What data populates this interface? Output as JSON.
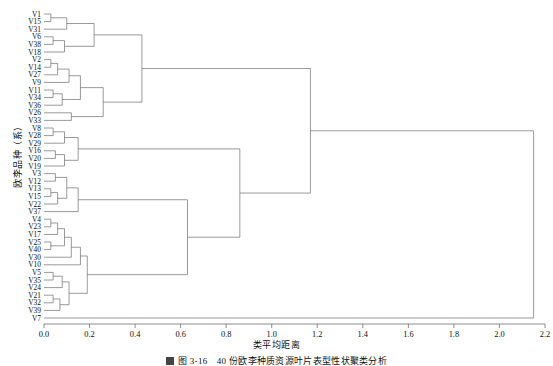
{
  "figure": {
    "y_axis_label": "欧李品种（系）",
    "x_axis_label": "类平均距离",
    "caption": "图 3-16　40 份欧李种质资源叶片表型性状聚类分析"
  },
  "chart_data": {
    "type": "dendrogram",
    "title": "",
    "xlabel": "类平均距离",
    "ylabel": "欧李品种（系）",
    "xlim": [
      0.0,
      2.2
    ],
    "xticks": [
      "0.0",
      "0.2",
      "0.4",
      "0.6",
      "0.8",
      "1.0",
      "1.2",
      "1.4",
      "1.6",
      "1.8",
      "2.0",
      "2.2"
    ],
    "xtick_values": [
      0.0,
      0.2,
      0.4,
      0.6,
      0.8,
      1.0,
      1.2,
      1.4,
      1.6,
      1.8,
      2.0,
      2.2
    ],
    "grid": false,
    "legend": "none",
    "orientation": "horizontal-left-to-right",
    "leaf_count": 40,
    "leaves": [
      "V1",
      "V15",
      "V31",
      "V6",
      "V38",
      "V18",
      "V2",
      "V14",
      "V27",
      "V9",
      "V11",
      "V34",
      "V36",
      "V26",
      "V33",
      "V8",
      "V28",
      "V29",
      "V16",
      "V20",
      "V19",
      "V3",
      "V12",
      "V13",
      "V15",
      "V22",
      "V37",
      "V4",
      "V23",
      "V17",
      "V25",
      "V40",
      "V30",
      "V10",
      "V5",
      "V35",
      "V24",
      "V21",
      "V32",
      "V39",
      "V7"
    ],
    "merges": [
      {
        "id": "m1",
        "children": [
          "V1",
          "V15"
        ],
        "height": 0.03
      },
      {
        "id": "m2",
        "children": [
          "m1",
          "V31"
        ],
        "height": 0.1
      },
      {
        "id": "m3",
        "children": [
          "V6",
          "V38"
        ],
        "height": 0.04
      },
      {
        "id": "m4",
        "children": [
          "m3",
          "V18"
        ],
        "height": 0.09
      },
      {
        "id": "m5",
        "children": [
          "m2",
          "m4"
        ],
        "height": 0.22
      },
      {
        "id": "m6",
        "children": [
          "V2",
          "V14"
        ],
        "height": 0.03
      },
      {
        "id": "m7",
        "children": [
          "m6",
          "V27"
        ],
        "height": 0.06
      },
      {
        "id": "m8",
        "children": [
          "V11",
          "V34"
        ],
        "height": 0.04
      },
      {
        "id": "m9",
        "children": [
          "m8",
          "V36"
        ],
        "height": 0.08
      },
      {
        "id": "m10",
        "children": [
          "m7",
          "V9"
        ],
        "height": 0.11
      },
      {
        "id": "m11",
        "children": [
          "m10",
          "m9"
        ],
        "height": 0.16
      },
      {
        "id": "m12",
        "children": [
          "V26",
          "V33"
        ],
        "height": 0.12
      },
      {
        "id": "m13",
        "children": [
          "m11",
          "m12"
        ],
        "height": 0.26
      },
      {
        "id": "m14",
        "children": [
          "m5",
          "m13"
        ],
        "height": 0.43
      },
      {
        "id": "m15",
        "children": [
          "V8",
          "V28"
        ],
        "height": 0.04
      },
      {
        "id": "m16",
        "children": [
          "m15",
          "V29"
        ],
        "height": 0.09
      },
      {
        "id": "m17",
        "children": [
          "V16",
          "V20"
        ],
        "height": 0.05
      },
      {
        "id": "m18",
        "children": [
          "m17",
          "V19"
        ],
        "height": 0.09
      },
      {
        "id": "m19",
        "children": [
          "m16",
          "m18"
        ],
        "height": 0.15
      },
      {
        "id": "m20",
        "children": [
          "V3",
          "V12"
        ],
        "height": 0.05
      },
      {
        "id": "m21",
        "children": [
          "V13",
          "V15b"
        ],
        "height": 0.03
      },
      {
        "id": "m22",
        "children": [
          "m21",
          "V22"
        ],
        "height": 0.06
      },
      {
        "id": "m23",
        "children": [
          "m20",
          "m22"
        ],
        "height": 0.1
      },
      {
        "id": "m24",
        "children": [
          "m23",
          "V37"
        ],
        "height": 0.15
      },
      {
        "id": "m25",
        "children": [
          "V4",
          "V23"
        ],
        "height": 0.03
      },
      {
        "id": "m26",
        "children": [
          "V25",
          "V40"
        ],
        "height": 0.03
      },
      {
        "id": "m27",
        "children": [
          "m25",
          "V17"
        ],
        "height": 0.06
      },
      {
        "id": "m28",
        "children": [
          "m27",
          "m26"
        ],
        "height": 0.09
      },
      {
        "id": "m29",
        "children": [
          "m28",
          "V30"
        ],
        "height": 0.12
      },
      {
        "id": "m30",
        "children": [
          "m29",
          "V10"
        ],
        "height": 0.16
      },
      {
        "id": "m31",
        "children": [
          "V5",
          "V35"
        ],
        "height": 0.04
      },
      {
        "id": "m32",
        "children": [
          "m31",
          "V24"
        ],
        "height": 0.08
      },
      {
        "id": "m33",
        "children": [
          "V21",
          "V32"
        ],
        "height": 0.04
      },
      {
        "id": "m34",
        "children": [
          "m33",
          "V39"
        ],
        "height": 0.07
      },
      {
        "id": "m35",
        "children": [
          "m32",
          "m34"
        ],
        "height": 0.11
      },
      {
        "id": "m36",
        "children": [
          "m30",
          "m35"
        ],
        "height": 0.19
      },
      {
        "id": "m37",
        "children": [
          "m24",
          "m36"
        ],
        "height": 0.63
      },
      {
        "id": "m38",
        "children": [
          "m19",
          "m37"
        ],
        "height": 0.86
      },
      {
        "id": "m39",
        "children": [
          "m14",
          "m38"
        ],
        "height": 1.17
      },
      {
        "id": "m40",
        "children": [
          "m39",
          "V7"
        ],
        "height": 2.15
      }
    ]
  }
}
